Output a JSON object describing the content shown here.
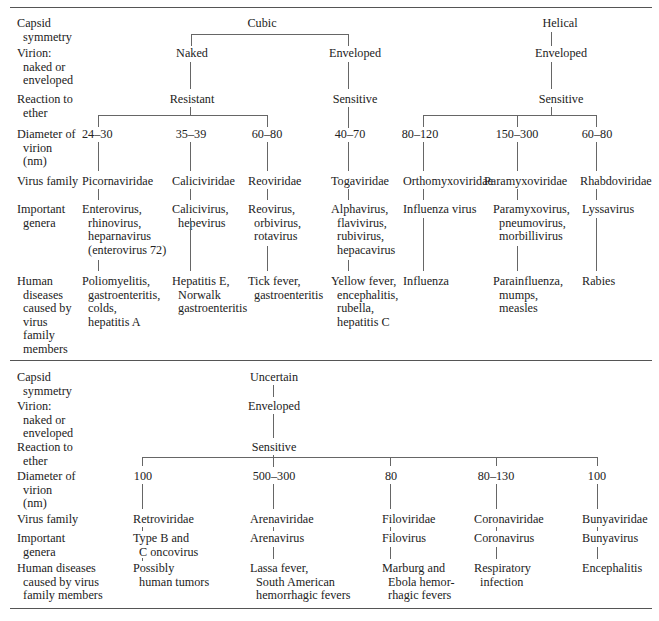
{
  "row_labels": {
    "top": {
      "capsid": "Capsid\n  symmetry",
      "virion": "Virion:\n  naked or\n  enveloped",
      "ether": "Reaction to\n  ether",
      "diameter": "Diameter of\n  virion\n  (nm)",
      "family": "Virus family",
      "genera": "Important\n  genera",
      "diseases": "Human\n  diseases\n  caused by\n  virus\n  family\n  members"
    },
    "bottom": {
      "capsid": "Capsid\n  symmetry",
      "virion": "Virion:\n  naked or\n  enveloped",
      "ether": "Reaction to\n  ether",
      "diameter": "Diameter of\n  virion\n  (nm)",
      "family": "Virus family",
      "genera": "Important\n  genera",
      "diseases": "Human diseases\n  caused by virus\n  family members"
    }
  },
  "top_section": {
    "capsid": [
      "Cubic",
      "Helical"
    ],
    "virion": [
      "Naked",
      "Enveloped",
      "Enveloped"
    ],
    "ether": [
      "Resistant",
      "Sensitive",
      "Sensitive"
    ],
    "families": [
      {
        "diameter": "24–30",
        "family": "Picornaviridae",
        "genera": "Enterovirus,\n  rhinovirus,\n  heparnavirus\n  (enterovirus 72)",
        "diseases": "Poliomyelitis,\n  gastroenteritis,\n  colds,\n  hepatitis A"
      },
      {
        "diameter": "35–39",
        "family": "Caliciviridae",
        "genera": "Calicivirus,\n  hepevirus",
        "diseases": "Hepatitis E,\n  Norwalk\n  gastroenteritis"
      },
      {
        "diameter": "60–80",
        "family": "Reoviridae",
        "genera": "Reovirus,\n  orbivirus,\n  rotavirus",
        "diseases": "Tick fever,\n  gastroenteritis"
      },
      {
        "diameter": "40–70",
        "family": "Togaviridae",
        "genera": "Alphavirus,\n  flavivirus,\n  rubivirus,\n  hepacavirus",
        "diseases": "Yellow fever,\n  encephalitis,\n  rubella,\n  hepatitis C"
      },
      {
        "diameter": "80–120",
        "family": "Orthomyxoviridae",
        "genera": "Influenza virus",
        "diseases": "Influenza"
      },
      {
        "diameter": "150–300",
        "family": "Paramyxoviridae",
        "genera": "Paramyxovirus,\n  pneumovirus,\n  morbillivirus",
        "diseases": "Parainfluenza,\n  mumps,\n  measles"
      },
      {
        "diameter": "60–80",
        "family": "Rhabdoviridae",
        "genera": "Lyssavirus",
        "diseases": "Rabies"
      }
    ]
  },
  "bottom_section": {
    "capsid": "Uncertain",
    "virion": "Enveloped",
    "ether": "Sensitive",
    "families": [
      {
        "diameter": "100",
        "family": "Retroviridae",
        "genera": "Type B and\n  C oncovirus",
        "diseases": "Possibly\n  human tumors"
      },
      {
        "diameter": "500–300",
        "family": "Arenaviridae",
        "genera": "Arenavirus",
        "diseases": "Lassa fever,\n  South American\n  hemorrhagic fevers"
      },
      {
        "diameter": "80",
        "family": "Filoviridae",
        "genera": "Filovirus",
        "diseases": "Marburg and\n  Ebola hemor-\n  rhagic fevers"
      },
      {
        "diameter": "80–130",
        "family": "Coronaviridae",
        "genera": "Coronavirus",
        "diseases": "Respiratory\n  infection"
      },
      {
        "diameter": "100",
        "family": "Bunyaviridae",
        "genera": "Bunyavirus",
        "diseases": "Encephalitis"
      }
    ]
  }
}
